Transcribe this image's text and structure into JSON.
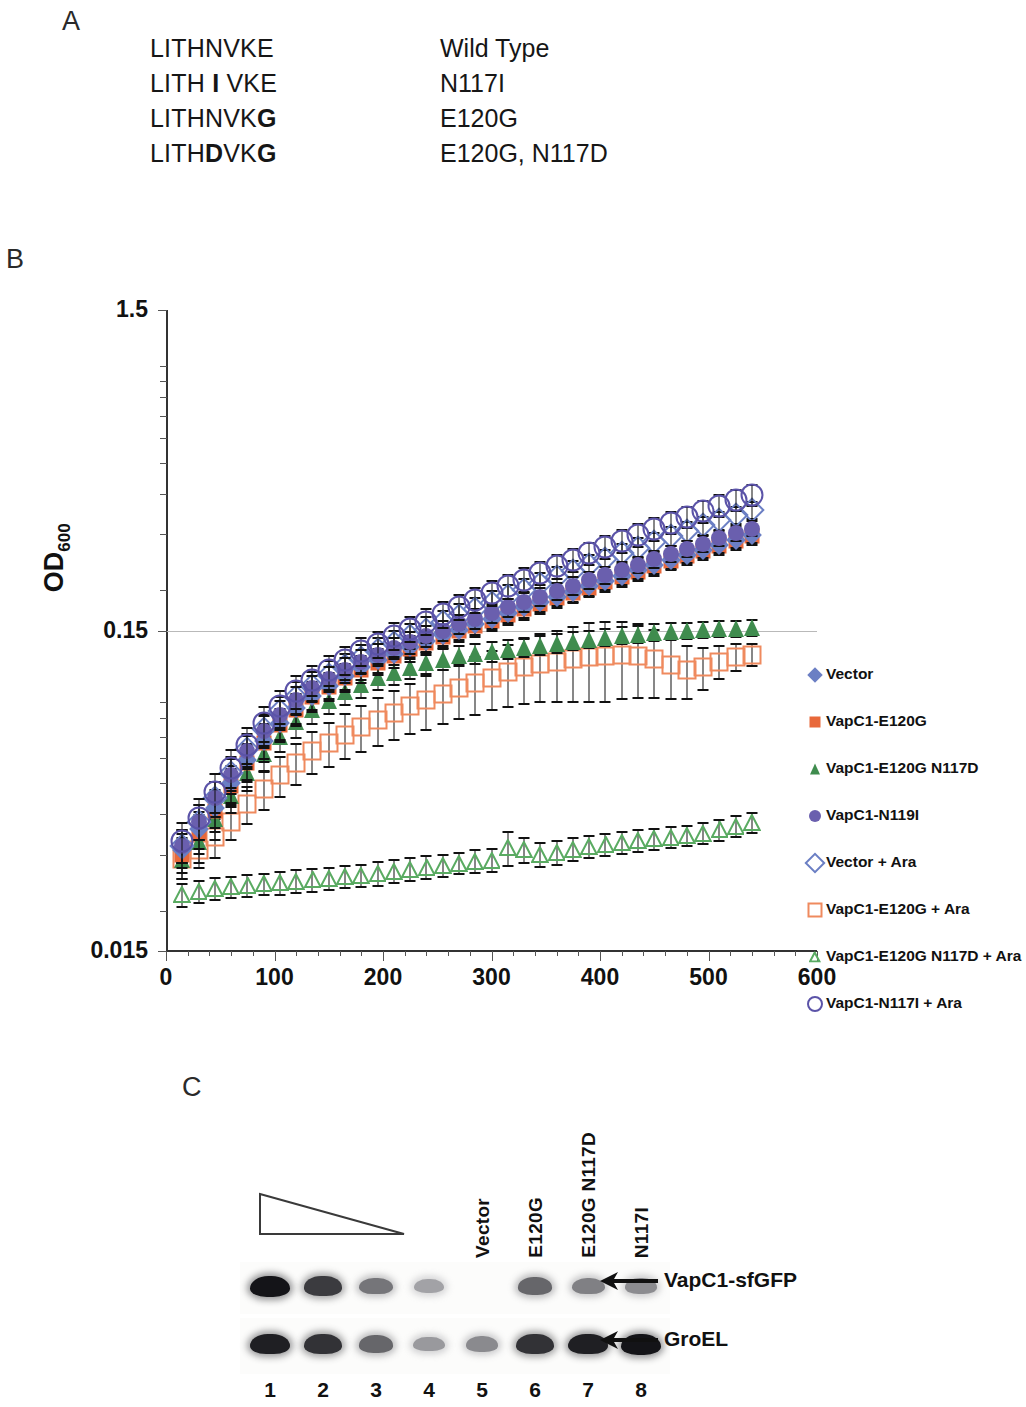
{
  "panels": {
    "a_letter": "A",
    "b_letter": "B",
    "c_letter": "C"
  },
  "panel_a": {
    "rows": [
      {
        "sequence_plain": "LITHNVKE",
        "sequence_html": "LITHNVKE",
        "annotation": "Wild Type"
      },
      {
        "sequence_plain": "LITH I VKE",
        "sequence_html": "LITH <b>I</b> VKE",
        "annotation": "N117I"
      },
      {
        "sequence_plain": "LITHNVKG",
        "sequence_html": "LITHNVK<b>G</b>",
        "annotation": "E120G"
      },
      {
        "sequence_plain": "LITHDVKG",
        "sequence_html": "LITH<b>D</b>VK<b>G</b>",
        "annotation": "E120G, N117D"
      }
    ]
  },
  "panel_b": {
    "legend_position": "right",
    "legend": [
      {
        "label": "Vector",
        "marker": "diamond",
        "fill": "solid",
        "color": "#6b7fc4"
      },
      {
        "label": "VapC1-E120G",
        "marker": "square",
        "fill": "solid",
        "color": "#e8683a"
      },
      {
        "label": "VapC1-E120G N117D",
        "marker": "triangle",
        "fill": "solid",
        "color": "#3f8c4e"
      },
      {
        "label": "VapC1-N119I",
        "marker": "circle",
        "fill": "solid",
        "color": "#6a5fae"
      },
      {
        "label": "Vector + Ara",
        "marker": "diamond",
        "fill": "open",
        "color": "#6b7fc4"
      },
      {
        "label": "VapC1-E120G + Ara",
        "marker": "square",
        "fill": "open",
        "color": "#ef8a5e"
      },
      {
        "label": "VapC1-E120G N117D + Ara",
        "marker": "triangle",
        "fill": "open",
        "color": "#5aab62"
      },
      {
        "label": "VapC1-N117I + Ara",
        "marker": "circle",
        "fill": "open",
        "color": "#5b53a8"
      }
    ]
  },
  "chart_data": {
    "type": "scatter",
    "title": "",
    "xlabel": "Time after induction (mins.)",
    "ylabel": "OD600",
    "ylabel_base": "OD",
    "ylabel_sub": "600",
    "xlim": [
      0,
      600
    ],
    "ylim": [
      0.015,
      1.5
    ],
    "yscale": "log",
    "ytick_labels": [
      "1.5",
      "0.15",
      "0.015"
    ],
    "ytick_values": [
      1.5,
      0.15,
      0.015
    ],
    "xtick_labels": [
      "0",
      "100",
      "200",
      "300",
      "400",
      "500",
      "600"
    ],
    "xtick_values": [
      0,
      100,
      200,
      300,
      400,
      500,
      600
    ],
    "x_minor_step": 20,
    "grid": "horizontal-at-0.15",
    "error_bars": true,
    "x": [
      15,
      30,
      45,
      60,
      75,
      90,
      105,
      120,
      135,
      150,
      165,
      180,
      195,
      210,
      225,
      240,
      255,
      270,
      285,
      300,
      315,
      330,
      345,
      360,
      375,
      390,
      405,
      420,
      435,
      450,
      465,
      480,
      495,
      510,
      525,
      540
    ],
    "series": [
      {
        "name": "Vector",
        "marker": "diamond",
        "fill": "solid",
        "color": "#6b7fc4",
        "values": [
          0.031,
          0.036,
          0.042,
          0.05,
          0.059,
          0.068,
          0.077,
          0.086,
          0.094,
          0.101,
          0.108,
          0.115,
          0.121,
          0.127,
          0.133,
          0.139,
          0.145,
          0.151,
          0.157,
          0.163,
          0.17,
          0.177,
          0.184,
          0.191,
          0.198,
          0.206,
          0.214,
          0.222,
          0.231,
          0.24,
          0.249,
          0.258,
          0.268,
          0.278,
          0.288,
          0.298
        ],
        "err": [
          0.004,
          0.005,
          0.006,
          0.007,
          0.008,
          0.009,
          0.009,
          0.01,
          0.01,
          0.01,
          0.011,
          0.011,
          0.011,
          0.011,
          0.012,
          0.012,
          0.012,
          0.012,
          0.013,
          0.013,
          0.013,
          0.014,
          0.014,
          0.014,
          0.015,
          0.015,
          0.015,
          0.016,
          0.016,
          0.017,
          0.017,
          0.017,
          0.018,
          0.018,
          0.019,
          0.019
        ]
      },
      {
        "name": "VapC1-E120G",
        "marker": "square",
        "fill": "solid",
        "color": "#e8683a",
        "values": [
          0.03,
          0.035,
          0.041,
          0.049,
          0.058,
          0.067,
          0.076,
          0.085,
          0.093,
          0.1,
          0.107,
          0.113,
          0.119,
          0.125,
          0.131,
          0.137,
          0.143,
          0.149,
          0.155,
          0.161,
          0.168,
          0.175,
          0.182,
          0.189,
          0.196,
          0.204,
          0.212,
          0.22,
          0.229,
          0.238,
          0.247,
          0.256,
          0.265,
          0.275,
          0.285,
          0.295
        ],
        "err": [
          0.004,
          0.005,
          0.006,
          0.007,
          0.008,
          0.009,
          0.009,
          0.01,
          0.01,
          0.01,
          0.011,
          0.011,
          0.011,
          0.011,
          0.012,
          0.012,
          0.012,
          0.012,
          0.013,
          0.013,
          0.013,
          0.014,
          0.014,
          0.014,
          0.015,
          0.015,
          0.015,
          0.016,
          0.016,
          0.017,
          0.017,
          0.017,
          0.018,
          0.018,
          0.019,
          0.019
        ]
      },
      {
        "name": "VapC1-E120G N117D",
        "marker": "triangle",
        "fill": "solid",
        "color": "#3f8c4e",
        "values": [
          0.029,
          0.033,
          0.039,
          0.046,
          0.054,
          0.062,
          0.07,
          0.078,
          0.085,
          0.091,
          0.097,
          0.102,
          0.107,
          0.111,
          0.115,
          0.119,
          0.122,
          0.125,
          0.127,
          0.129,
          0.131,
          0.133,
          0.135,
          0.137,
          0.139,
          0.141,
          0.143,
          0.145,
          0.146,
          0.148,
          0.149,
          0.15,
          0.151,
          0.152,
          0.152,
          0.153
        ],
        "err": [
          0.004,
          0.005,
          0.006,
          0.006,
          0.007,
          0.008,
          0.008,
          0.009,
          0.009,
          0.009,
          0.01,
          0.01,
          0.01,
          0.01,
          0.01,
          0.01,
          0.01,
          0.01,
          0.01,
          0.01,
          0.01,
          0.01,
          0.01,
          0.01,
          0.01,
          0.01,
          0.01,
          0.01,
          0.01,
          0.01,
          0.01,
          0.01,
          0.01,
          0.01,
          0.01,
          0.01
        ]
      },
      {
        "name": "VapC1-N119I",
        "marker": "circle",
        "fill": "solid",
        "color": "#6a5fae",
        "values": [
          0.032,
          0.038,
          0.045,
          0.053,
          0.063,
          0.073,
          0.082,
          0.091,
          0.099,
          0.106,
          0.113,
          0.12,
          0.126,
          0.132,
          0.138,
          0.144,
          0.15,
          0.157,
          0.163,
          0.17,
          0.177,
          0.184,
          0.191,
          0.199,
          0.207,
          0.215,
          0.223,
          0.232,
          0.241,
          0.25,
          0.26,
          0.27,
          0.28,
          0.291,
          0.302,
          0.312
        ],
        "err": [
          0.004,
          0.005,
          0.006,
          0.007,
          0.008,
          0.009,
          0.009,
          0.01,
          0.01,
          0.01,
          0.011,
          0.011,
          0.011,
          0.011,
          0.012,
          0.012,
          0.012,
          0.012,
          0.013,
          0.013,
          0.013,
          0.014,
          0.014,
          0.014,
          0.015,
          0.015,
          0.015,
          0.016,
          0.016,
          0.017,
          0.017,
          0.017,
          0.018,
          0.018,
          0.019,
          0.019
        ]
      },
      {
        "name": "Vector + Ara",
        "marker": "diamond",
        "fill": "open",
        "color": "#6b7fc4",
        "values": [
          0.032,
          0.038,
          0.045,
          0.054,
          0.064,
          0.074,
          0.084,
          0.093,
          0.101,
          0.109,
          0.116,
          0.123,
          0.13,
          0.137,
          0.144,
          0.151,
          0.159,
          0.167,
          0.175,
          0.183,
          0.192,
          0.201,
          0.21,
          0.22,
          0.23,
          0.24,
          0.25,
          0.261,
          0.272,
          0.283,
          0.295,
          0.307,
          0.319,
          0.331,
          0.344,
          0.356
        ],
        "err": [
          0.004,
          0.005,
          0.006,
          0.007,
          0.008,
          0.009,
          0.01,
          0.011,
          0.011,
          0.012,
          0.012,
          0.013,
          0.013,
          0.014,
          0.014,
          0.015,
          0.015,
          0.016,
          0.016,
          0.017,
          0.017,
          0.018,
          0.018,
          0.019,
          0.019,
          0.02,
          0.02,
          0.021,
          0.021,
          0.022,
          0.022,
          0.023,
          0.023,
          0.024,
          0.024,
          0.025
        ]
      },
      {
        "name": "VapC1-E120G + Ara",
        "marker": "square",
        "fill": "open",
        "color": "#ef8a5e",
        "values": [
          0.029,
          0.031,
          0.034,
          0.038,
          0.043,
          0.048,
          0.053,
          0.058,
          0.063,
          0.067,
          0.071,
          0.075,
          0.079,
          0.083,
          0.087,
          0.091,
          0.095,
          0.099,
          0.103,
          0.107,
          0.111,
          0.115,
          0.118,
          0.12,
          0.122,
          0.124,
          0.125,
          0.126,
          0.125,
          0.122,
          0.117,
          0.113,
          0.115,
          0.12,
          0.124,
          0.126
        ],
        "err": [
          0.004,
          0.004,
          0.005,
          0.005,
          0.006,
          0.007,
          0.008,
          0.009,
          0.01,
          0.011,
          0.012,
          0.013,
          0.014,
          0.015,
          0.016,
          0.018,
          0.019,
          0.02,
          0.022,
          0.023,
          0.025,
          0.027,
          0.029,
          0.031,
          0.033,
          0.035,
          0.036,
          0.035,
          0.033,
          0.03,
          0.026,
          0.022,
          0.018,
          0.015,
          0.013,
          0.011
        ]
      },
      {
        "name": "VapC1-E120G N117D + Ara",
        "marker": "triangle",
        "fill": "open",
        "color": "#5aab62",
        "values": [
          0.0225,
          0.023,
          0.0235,
          0.0238,
          0.024,
          0.0243,
          0.0245,
          0.0248,
          0.025,
          0.0253,
          0.0256,
          0.0258,
          0.0262,
          0.0266,
          0.027,
          0.0274,
          0.0278,
          0.0282,
          0.0286,
          0.0288,
          0.0315,
          0.031,
          0.03,
          0.0305,
          0.0312,
          0.0318,
          0.0322,
          0.0328,
          0.0332,
          0.0336,
          0.034,
          0.0344,
          0.035,
          0.0358,
          0.0368,
          0.0378
        ],
        "err": [
          0.002,
          0.002,
          0.002,
          0.002,
          0.002,
          0.002,
          0.0022,
          0.0022,
          0.0022,
          0.0022,
          0.0022,
          0.0022,
          0.0024,
          0.0024,
          0.0024,
          0.0024,
          0.0024,
          0.0024,
          0.0026,
          0.0026,
          0.004,
          0.003,
          0.0028,
          0.0028,
          0.0028,
          0.0028,
          0.0028,
          0.0028,
          0.0028,
          0.0028,
          0.0028,
          0.0028,
          0.0028,
          0.003,
          0.003,
          0.003
        ]
      },
      {
        "name": "VapC1-N117I + Ara",
        "marker": "circle",
        "fill": "open",
        "color": "#5b53a8",
        "values": [
          0.033,
          0.039,
          0.047,
          0.056,
          0.066,
          0.077,
          0.087,
          0.097,
          0.105,
          0.113,
          0.121,
          0.129,
          0.136,
          0.144,
          0.152,
          0.16,
          0.169,
          0.178,
          0.187,
          0.196,
          0.206,
          0.216,
          0.227,
          0.238,
          0.249,
          0.261,
          0.273,
          0.285,
          0.298,
          0.311,
          0.325,
          0.339,
          0.353,
          0.368,
          0.383,
          0.396
        ],
        "err": [
          0.005,
          0.006,
          0.007,
          0.008,
          0.009,
          0.01,
          0.011,
          0.012,
          0.012,
          0.013,
          0.013,
          0.014,
          0.014,
          0.015,
          0.015,
          0.016,
          0.017,
          0.017,
          0.018,
          0.019,
          0.019,
          0.02,
          0.021,
          0.022,
          0.022,
          0.023,
          0.024,
          0.025,
          0.026,
          0.027,
          0.028,
          0.029,
          0.03,
          0.031,
          0.032,
          0.033
        ]
      }
    ]
  },
  "panel_c": {
    "wedge_icon": "dilution-wedge-triangle",
    "lane_labels": [
      "Vector",
      "E120G",
      "E120G N117D",
      "N117I"
    ],
    "lane_numbers": [
      "1",
      "2",
      "3",
      "4",
      "5",
      "6",
      "7",
      "8"
    ],
    "band_labels": [
      "VapC1-sfGFP",
      "GroEL"
    ],
    "blot_rows": [
      {
        "name": "VapC1-sfGFP",
        "intensities": [
          1.0,
          0.82,
          0.55,
          0.34,
          0.0,
          0.62,
          0.5,
          0.44
        ]
      },
      {
        "name": "GroEL",
        "intensities": [
          0.95,
          0.86,
          0.62,
          0.38,
          0.45,
          0.86,
          0.95,
          1.0
        ]
      }
    ]
  }
}
